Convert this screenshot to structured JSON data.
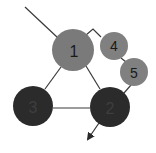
{
  "diagram": {
    "type": "graph",
    "nodes": [
      {
        "id": "1",
        "label": "1",
        "cx": 73,
        "cy": 50,
        "r": 21,
        "fill": "#7a7a7a",
        "text_color": "#1a1a1a"
      },
      {
        "id": "2",
        "label": "2",
        "cx": 110,
        "cy": 107,
        "r": 20,
        "fill": "#2b2b2b",
        "text_color": "#3e3e3e"
      },
      {
        "id": "3",
        "label": "3",
        "cx": 33,
        "cy": 106,
        "r": 20,
        "fill": "#2b2b2b",
        "text_color": "#3e3e3e"
      },
      {
        "id": "4",
        "label": "4",
        "cx": 114,
        "cy": 46,
        "r": 14,
        "fill": "#808080",
        "text_color": "#1a1a1a"
      },
      {
        "id": "5",
        "label": "5",
        "cx": 134,
        "cy": 72,
        "r": 14,
        "fill": "#808080",
        "text_color": "#1a1a1a"
      }
    ],
    "edges": [
      {
        "from": "external-top-left",
        "to": "1"
      },
      {
        "from": "1",
        "to": "3"
      },
      {
        "from": "1",
        "to": "2"
      },
      {
        "from": "3",
        "to": "2"
      },
      {
        "from": "1",
        "to": "4",
        "bent": true
      },
      {
        "from": "4",
        "to": "5"
      },
      {
        "from": "5",
        "to": "2"
      },
      {
        "from": "2",
        "to": "external-bottom",
        "arrow": true
      }
    ]
  }
}
